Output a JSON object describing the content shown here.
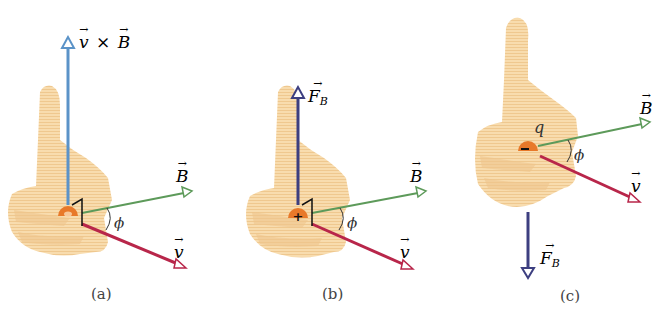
{
  "colors": {
    "hand": "#f7d6a4",
    "hand_shade": "#eec58a",
    "vxb_arrow": "#5b93c8",
    "force_arrow": "#3d3f80",
    "B_arrow": "#5d9a5a",
    "v_arrow": "#b8264a",
    "charge": "#e8792a",
    "text": "#333333"
  },
  "panels": [
    {
      "id": "a",
      "caption": "(a)",
      "vertical_vector_label": "v × B",
      "vertical_vector_parts": [
        "v",
        "×",
        "B"
      ],
      "vertical_direction": "up",
      "charge_sign": "",
      "B_label": "B",
      "v_label": "v",
      "angle_label": "ϕ"
    },
    {
      "id": "b",
      "caption": "(b)",
      "vertical_vector_label": "F_B",
      "vertical_vector_main": "F",
      "vertical_vector_sub": "B",
      "vertical_direction": "up",
      "charge_sign": "+",
      "B_label": "B",
      "v_label": "v",
      "angle_label": "ϕ"
    },
    {
      "id": "c",
      "caption": "(c)",
      "vertical_vector_label": "F_B",
      "vertical_vector_main": "F",
      "vertical_vector_sub": "B",
      "vertical_direction": "down",
      "charge_sign": "−",
      "charge_label": "q",
      "B_label": "B",
      "v_label": "v",
      "angle_label": "ϕ"
    }
  ],
  "arrow_glyph": "→"
}
